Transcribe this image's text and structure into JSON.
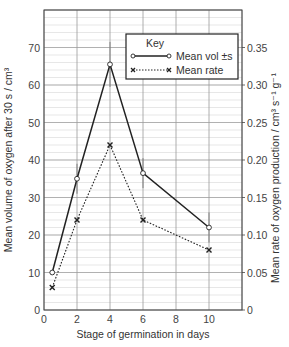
{
  "chart_data": {
    "type": "line",
    "title": "",
    "xlabel": "Stage of germination in days",
    "ylabel": "Mean volume of oxygen after 30 s / cm³",
    "y2label": "Mean rate of oxygen production / cm³ s⁻¹ g⁻¹",
    "xlim": [
      0,
      12
    ],
    "ylim": [
      0,
      80
    ],
    "y2lim": [
      0,
      0.4
    ],
    "x_ticks": [
      0,
      2,
      4,
      6,
      8,
      10
    ],
    "y_ticks": [
      0,
      10,
      20,
      30,
      40,
      50,
      60,
      70
    ],
    "y2_ticks": [
      "0",
      "0.05",
      "0.10",
      "0.15",
      "0.20",
      "0.25",
      "0.30",
      "0.35"
    ],
    "grid": true,
    "legend_position": "upper right",
    "legend_title": "Key",
    "x": [
      0.5,
      2,
      4,
      6,
      10
    ],
    "series": [
      {
        "name": "Mean vol ±s",
        "axis": "left",
        "style": "solid",
        "marker": "open-circle",
        "values": [
          10,
          35,
          65.5,
          36.5,
          22
        ],
        "error": [
          0,
          4,
          6,
          4,
          4
        ]
      },
      {
        "name": "Mean rate",
        "axis": "right",
        "style": "dotted",
        "marker": "cross",
        "values": [
          0.03,
          0.12,
          0.22,
          0.12,
          0.08
        ]
      }
    ]
  },
  "legend": {
    "title": "Key",
    "items": [
      {
        "label": "Mean vol ±s"
      },
      {
        "label": "Mean rate"
      }
    ]
  },
  "axes": {
    "x_title": "Stage of germination in days",
    "y_title": "Mean volume of oxygen after 30 s / cm³",
    "y2_title": "Mean rate of oxygen production / cm³ s⁻¹ g⁻¹"
  },
  "colors": {
    "line": "#222222",
    "grid_major": "#9a9a9a",
    "grid_minor": "#d6d6d6",
    "axis": "#444444"
  }
}
